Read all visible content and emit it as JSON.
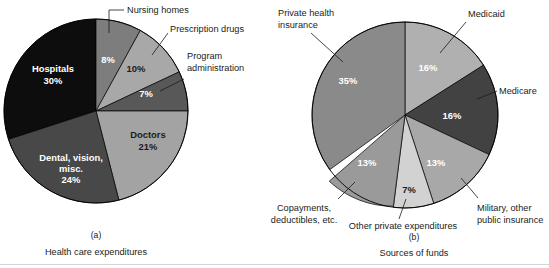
{
  "figure": {
    "background": "#ffffff",
    "text_color": "#1b1b1b"
  },
  "chart_data": [
    {
      "type": "pie",
      "id": "health-care-expenditures",
      "panel_letter": "(a)",
      "title": "Health care expenditures",
      "start_angle_deg": 0,
      "direction": "clockwise",
      "center": {
        "x": 96,
        "y": 111
      },
      "radius": 92,
      "categories": [
        "Nursing homes",
        "Prescription drugs",
        "Program administration",
        "Doctors",
        "Dental, vision, misc.",
        "Hospitals"
      ],
      "values": [
        8,
        10,
        7,
        21,
        24,
        30
      ],
      "value_labels": [
        "8%",
        "10%",
        "7%",
        "21%",
        "24%",
        "30%"
      ],
      "colors": [
        "#7d7d7d",
        "#a8a8a8",
        "#585858",
        "#a3a3a3",
        "#484848",
        "#0d0d0d"
      ],
      "label_placement": [
        "leader",
        "leader",
        "leader",
        "inside",
        "inside",
        "inside"
      ],
      "slices": [
        {
          "name": "Nursing homes",
          "value": 8,
          "label": "8%",
          "color": "#7d7d7d",
          "label_fill": "#ffffff"
        },
        {
          "name": "Prescription drugs",
          "value": 10,
          "label": "10%",
          "color": "#a8a8a8",
          "label_fill": "#1b1b1b"
        },
        {
          "name": "Program administration",
          "value": 7,
          "label": "7%",
          "color": "#585858",
          "label_fill": "#ffffff"
        },
        {
          "name": "Doctors",
          "value": 21,
          "label": "21%",
          "color": "#a3a3a3",
          "label_fill": "#1b1b1b"
        },
        {
          "name": "Dental, vision, misc.",
          "value": 24,
          "label": "24%",
          "color": "#484848",
          "label_fill": "#ffffff"
        },
        {
          "name": "Hospitals",
          "value": 30,
          "label": "30%",
          "color": "#0d0d0d",
          "label_fill": "#ffffff"
        }
      ]
    },
    {
      "type": "pie",
      "id": "sources-of-funds",
      "panel_letter": "(b)",
      "title": "Sources of funds",
      "start_angle_deg": 0,
      "direction": "clockwise",
      "center": {
        "x": 405,
        "y": 115
      },
      "radius": 93,
      "categories": [
        "Medicaid",
        "Medicare",
        "Military, other public insurance",
        "Other private expenditures",
        "Copayments, deductibles, etc.",
        "Private health insurance"
      ],
      "values": [
        16,
        16,
        13,
        7,
        13,
        35
      ],
      "value_labels": [
        "16%",
        "16%",
        "13%",
        "7%",
        "13%",
        "35%"
      ],
      "colors": [
        "#b0b0b0",
        "#424242",
        "#a8a8a8",
        "#d2d2d2",
        "#9a9a9a",
        "#8a8a8a"
      ],
      "label_placement": [
        "leader",
        "leader",
        "leader",
        "leader",
        "leader",
        "leader"
      ],
      "slices": [
        {
          "name": "Medicaid",
          "value": 16,
          "label": "16%",
          "color": "#b0b0b0",
          "label_fill": "#ffffff"
        },
        {
          "name": "Medicare",
          "value": 16,
          "label": "16%",
          "color": "#424242",
          "label_fill": "#ffffff"
        },
        {
          "name": "Military, other public insurance",
          "value": 13,
          "label": "13%",
          "color": "#a8a8a8",
          "label_fill": "#ffffff"
        },
        {
          "name": "Other private expenditures",
          "value": 7,
          "label": "7%",
          "color": "#d2d2d2",
          "label_fill": "#1b1b1b"
        },
        {
          "name": "Copayments, deductibles, etc.",
          "value": 13,
          "label": "13%",
          "color": "#9a9a9a",
          "label_fill": "#ffffff"
        },
        {
          "name": "Private health insurance",
          "value": 35,
          "label": "35%",
          "color": "#8a8a8a",
          "label_fill": "#ffffff"
        }
      ]
    }
  ],
  "annotations": {
    "left": {
      "nursing_homes": "Nursing homes",
      "prescription_drugs": "Prescription drugs",
      "program_administration_line1": "Program",
      "program_administration_line2": "administration",
      "hospitals_line1": "Hospitals",
      "hospitals_line2": "30%",
      "doctors_line1": "Doctors",
      "doctors_line2": "21%",
      "dental_line1": "Dental, vision,",
      "dental_line2": "misc.",
      "dental_line3": "24%",
      "pct_nursing": "8%",
      "pct_prescription": "10%",
      "pct_program": "7%"
    },
    "right": {
      "private_health_line1": "Private health",
      "private_health_line2": "insurance",
      "medicaid": "Medicaid",
      "medicare": "Medicare",
      "military_line1": "Military, other",
      "military_line2": "public insurance",
      "other_private": "Other private expenditures",
      "copayments_line1": "Copayments,",
      "copayments_line2": "deductibles, etc.",
      "pct_medicaid": "16%",
      "pct_medicare": "16%",
      "pct_military": "13%",
      "pct_other_private": "7%",
      "pct_copayments": "13%",
      "pct_private_health": "35%"
    }
  },
  "captions": {
    "panel_a_letter": "(a)",
    "panel_a_title": "Health care expenditures",
    "panel_b_letter": "(b)",
    "panel_b_title": "Sources of funds"
  }
}
